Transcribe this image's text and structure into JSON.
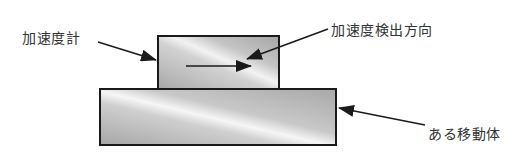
{
  "diagram": {
    "labels": {
      "accelerometer": "加速度計",
      "detection_direction": "加速度検出方向",
      "moving_body": "ある移動体"
    },
    "colors": {
      "box_fill_dark": "#a9a9a9",
      "box_fill_light": "#f4f4f4",
      "stroke": "#1a1a1a",
      "text": "#333333"
    }
  }
}
